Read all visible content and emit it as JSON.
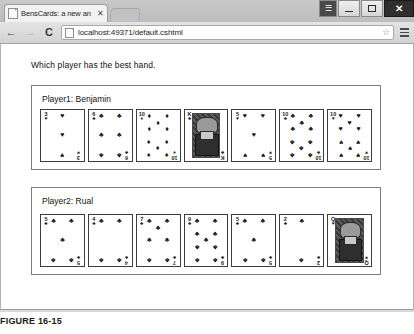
{
  "window": {
    "tab_title": "BensCards: a new an",
    "tab_close_glyph": "✕",
    "controls": {
      "user_glyph": "☰",
      "minimize_label": "Minimize",
      "maximize_label": "Maximize",
      "close_glyph": "✕"
    }
  },
  "toolbar": {
    "back_glyph": "←",
    "forward_glyph": "→",
    "reload_glyph": "C",
    "url": "localhost:49371/default.cshtml",
    "url_placeholder": "Search Google or type a URL",
    "star_glyph": "☆",
    "menu_label": "Customize and control Google Chrome"
  },
  "page": {
    "question": "Which player has the best hand.",
    "players": [
      {
        "label": "Player1: Benjamin",
        "cards": [
          {
            "rank": "3",
            "suit": "♥",
            "suit_name": "hearts",
            "count": 3,
            "face": false
          },
          {
            "rank": "6",
            "suit": "♣",
            "suit_name": "clubs",
            "count": 6,
            "face": false
          },
          {
            "rank": "10",
            "suit": "♦",
            "suit_name": "diamonds",
            "count": 10,
            "face": false
          },
          {
            "rank": "K",
            "suit": "♣",
            "suit_name": "clubs",
            "count": 0,
            "face": true
          },
          {
            "rank": "5",
            "suit": "♥",
            "suit_name": "hearts",
            "count": 5,
            "face": false
          },
          {
            "rank": "10",
            "suit": "♣",
            "suit_name": "clubs",
            "count": 10,
            "face": false
          },
          {
            "rank": "10",
            "suit": "♥",
            "suit_name": "hearts",
            "count": 10,
            "face": false
          }
        ]
      },
      {
        "label": "Player2: Rual",
        "cards": [
          {
            "rank": "5",
            "suit": "♣",
            "suit_name": "clubs",
            "count": 5,
            "face": false
          },
          {
            "rank": "4",
            "suit": "♣",
            "suit_name": "clubs",
            "count": 4,
            "face": false
          },
          {
            "rank": "7",
            "suit": "♣",
            "suit_name": "clubs",
            "count": 7,
            "face": false
          },
          {
            "rank": "9",
            "suit": "♣",
            "suit_name": "clubs",
            "count": 9,
            "face": false
          },
          {
            "rank": "5",
            "suit": "♣",
            "suit_name": "clubs",
            "count": 5,
            "face": false
          },
          {
            "rank": "2",
            "suit": "♣",
            "suit_name": "clubs",
            "count": 2,
            "face": false
          },
          {
            "rank": "Q",
            "suit": "♥",
            "suit_name": "hearts",
            "count": 0,
            "face": true
          }
        ]
      }
    ]
  },
  "figure": {
    "caption": "FIGURE 16-15"
  }
}
